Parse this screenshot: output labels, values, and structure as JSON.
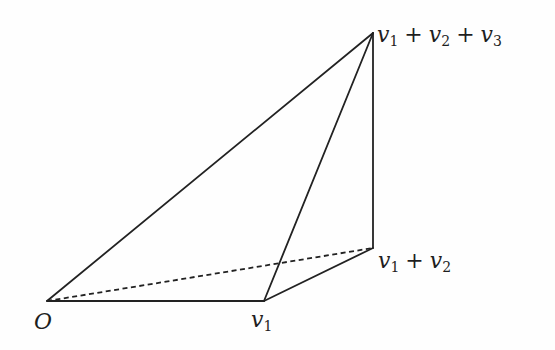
{
  "diagram": {
    "title": "",
    "type": "parallelepiped-simplex",
    "stroke_color": "#222222",
    "background_color": "#fefefe",
    "points": {
      "O": {
        "x": 47,
        "y": 301,
        "label": "O"
      },
      "v1": {
        "x": 264,
        "y": 301,
        "label": "v1"
      },
      "v1_plus_v2": {
        "x": 373,
        "y": 248,
        "label": "v1 + v2"
      },
      "v1_plus_v2_plus_v3": {
        "x": 373,
        "y": 33,
        "label": "v1 + v2 + v3"
      }
    },
    "edges": [
      {
        "from": "O",
        "to": "v1",
        "style": "solid"
      },
      {
        "from": "O",
        "to": "v1_plus_v2_plus_v3",
        "style": "solid"
      },
      {
        "from": "v1",
        "to": "v1_plus_v2_plus_v3",
        "style": "solid"
      },
      {
        "from": "v1",
        "to": "v1_plus_v2",
        "style": "solid"
      },
      {
        "from": "v1_plus_v2",
        "to": "v1_plus_v2_plus_v3",
        "style": "solid"
      },
      {
        "from": "O",
        "to": "v1_plus_v2",
        "style": "dashed"
      }
    ],
    "labels": {
      "origin": {
        "var": "O"
      },
      "v1": {
        "base": "v",
        "sub": "1"
      },
      "v1_plus_v2": {
        "terms": [
          {
            "base": "v",
            "sub": "1"
          },
          {
            "base": "v",
            "sub": "2"
          }
        ],
        "operator": "+"
      },
      "v1_plus_v2_plus_v3": {
        "terms": [
          {
            "base": "v",
            "sub": "1"
          },
          {
            "base": "v",
            "sub": "2"
          },
          {
            "base": "v",
            "sub": "3"
          }
        ],
        "operator": "+"
      }
    }
  }
}
